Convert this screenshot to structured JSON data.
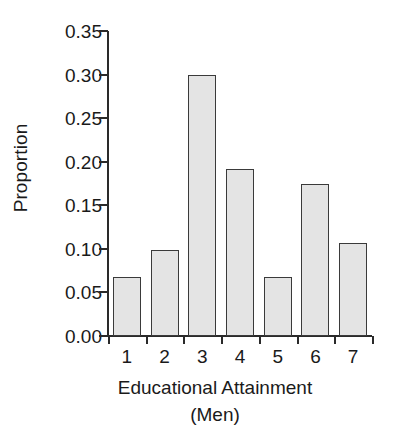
{
  "chart_data": {
    "type": "bar",
    "title": "",
    "subtitle": "",
    "categories": [
      "1",
      "2",
      "3",
      "4",
      "5",
      "6",
      "7"
    ],
    "values": [
      0.068,
      0.099,
      0.299,
      0.192,
      0.068,
      0.174,
      0.107
    ],
    "series": [
      {
        "name": "Proportion",
        "values": [
          0.068,
          0.099,
          0.299,
          0.192,
          0.068,
          0.174,
          0.107
        ]
      }
    ],
    "xlabel": "Educational Attainment",
    "xlabel_line2": "(Men)",
    "ylabel": "Proportion",
    "ylim": [
      0.0,
      0.35
    ],
    "xlim": [
      0,
      7
    ],
    "ytick_values": [
      0.0,
      0.05,
      0.1,
      0.15,
      0.2,
      0.25,
      0.3,
      0.35
    ],
    "ytick_labels": [
      "0.00",
      "0.05",
      "0.10",
      "0.15",
      "0.20",
      "0.25",
      "0.30",
      "0.35"
    ],
    "xtick_labels": [
      "1",
      "2",
      "3",
      "4",
      "5",
      "6",
      "7"
    ],
    "grid": false,
    "legend": "none",
    "colors": {
      "bar_fill": "#e4e4e4",
      "bar_edge": "#3a3a3a",
      "axis": "#2a2a2a",
      "text": "#1a1a1a",
      "background": "#ffffff"
    }
  }
}
